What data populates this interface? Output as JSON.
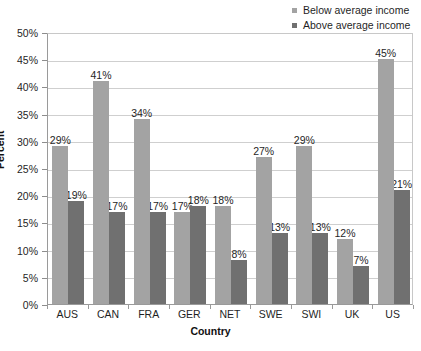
{
  "chart_data": {
    "type": "bar",
    "title": "",
    "xlabel": "Country",
    "ylabel": "Percent",
    "categories": [
      "AUS",
      "CAN",
      "FRA",
      "GER",
      "NET",
      "SWE",
      "SWI",
      "UK",
      "US"
    ],
    "series": [
      {
        "name": "Below average income",
        "color": "#a3a3a3",
        "values": [
          29,
          41,
          34,
          17,
          18,
          27,
          29,
          12,
          45
        ],
        "labels": [
          "29%",
          "41%",
          "34%",
          "17%",
          "18%",
          "27%",
          "29%",
          "12%",
          "45%"
        ]
      },
      {
        "name": "Above average income",
        "color": "#707070",
        "values": [
          19,
          17,
          17,
          18,
          8,
          13,
          13,
          7,
          21
        ],
        "labels": [
          "19%",
          "17%",
          "17%",
          "18%",
          "8%",
          "13%",
          "13%",
          "7%",
          "21%"
        ]
      }
    ],
    "ylim": [
      0,
      50
    ],
    "ytick_values": [
      0,
      5,
      10,
      15,
      20,
      25,
      30,
      35,
      40,
      45,
      50
    ],
    "ytick_labels": [
      "0%",
      "5%",
      "10%",
      "15%",
      "20%",
      "25%",
      "30%",
      "35%",
      "40%",
      "45%",
      "50%"
    ],
    "grid": "horizontal",
    "legend_position": "top-right",
    "legend": [
      "Below average income",
      "Above average income"
    ]
  }
}
